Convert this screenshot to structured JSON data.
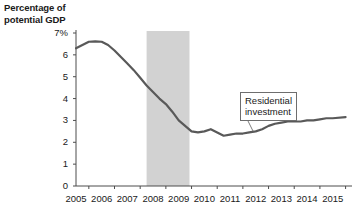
{
  "chart_data": {
    "type": "line",
    "title": "",
    "ylabel": "Percentage of potential GDP",
    "xlabel": "",
    "ylim": [
      0,
      7
    ],
    "xlim": [
      2005,
      2015.75
    ],
    "grid": false,
    "legend": null,
    "ytick_labels": [
      "0",
      "1",
      "2",
      "3",
      "4",
      "5",
      "6",
      "7%"
    ],
    "ytick_values": [
      0,
      1,
      2,
      3,
      4,
      5,
      6,
      7
    ],
    "xtick_labels": [
      "2005",
      "2006",
      "2007",
      "2008",
      "2009",
      "2010",
      "2011",
      "2012",
      "2013",
      "2014",
      "2015"
    ],
    "xtick_values": [
      2005,
      2006,
      2007,
      2008,
      2009,
      2010,
      2011,
      2012,
      2013,
      2014,
      2015
    ],
    "series": [
      {
        "name": "Residential investment",
        "color": "#595959",
        "x": [
          2005.0,
          2005.25,
          2005.5,
          2005.75,
          2006.0,
          2006.25,
          2006.5,
          2006.75,
          2007.0,
          2007.25,
          2007.5,
          2007.75,
          2008.0,
          2008.25,
          2008.5,
          2008.75,
          2009.0,
          2009.25,
          2009.5,
          2009.75,
          2010.0,
          2010.25,
          2010.5,
          2010.75,
          2011.0,
          2011.25,
          2011.5,
          2011.75,
          2012.0,
          2012.25,
          2012.5,
          2012.75,
          2013.0,
          2013.25,
          2013.5,
          2013.75,
          2014.0,
          2014.25,
          2014.5,
          2014.75,
          2015.0,
          2015.5
        ],
        "y": [
          6.3,
          6.45,
          6.6,
          6.62,
          6.6,
          6.45,
          6.2,
          5.9,
          5.6,
          5.3,
          4.95,
          4.6,
          4.3,
          4.0,
          3.75,
          3.4,
          3.0,
          2.75,
          2.5,
          2.45,
          2.5,
          2.6,
          2.45,
          2.3,
          2.35,
          2.4,
          2.4,
          2.45,
          2.5,
          2.6,
          2.75,
          2.85,
          2.9,
          2.95,
          2.95,
          2.95,
          3.0,
          3.0,
          3.05,
          3.1,
          3.1,
          3.15
        ]
      }
    ],
    "annotations": [
      {
        "name": "residential-investment-callout",
        "text_line1": "Residential",
        "text_line2": "investment",
        "points_to_x": 2011.9,
        "points_to_y": 2.5
      }
    ],
    "shaded_regions": [
      {
        "name": "recession-band",
        "x_start": 2007.75,
        "x_end": 2009.42,
        "color": "#d2d2d2"
      }
    ]
  }
}
